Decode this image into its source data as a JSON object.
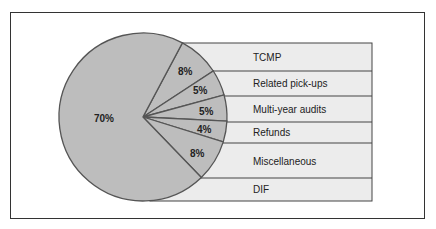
{
  "chart_data": {
    "type": "pie",
    "title": "",
    "slices": [
      {
        "label": "TCMP",
        "value": 8,
        "display": "8%"
      },
      {
        "label": "Related pick-ups",
        "value": 5,
        "display": "5%"
      },
      {
        "label": "Multi-year audits",
        "value": 5,
        "display": "5%"
      },
      {
        "label": "Refunds",
        "value": 4,
        "display": "4%"
      },
      {
        "label": "Miscellaneous",
        "value": 8,
        "display": "8%"
      },
      {
        "label": "DIF",
        "value": 70,
        "display": "70%"
      }
    ],
    "legend_position": "right (labeled bands)"
  },
  "colors": {
    "pie_fill": "#bdbdbd",
    "pie_stroke": "#555555",
    "band_fill": "#ececec",
    "band_stroke": "#444444",
    "frame": "#333333"
  },
  "labels": {
    "tcmp": "TCMP",
    "related": "Related pick-ups",
    "multiyear": "Multi-year audits",
    "refunds": "Refunds",
    "misc": "Miscellaneous",
    "dif": "DIF",
    "pct_tcmp": "8%",
    "pct_related": "5%",
    "pct_multiyear": "5%",
    "pct_refunds": "4%",
    "pct_misc": "8%",
    "pct_dif": "70%"
  }
}
